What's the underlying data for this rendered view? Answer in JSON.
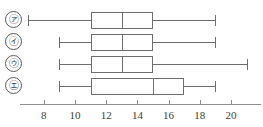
{
  "chart_data": {
    "type": "box",
    "title": "",
    "xlabel": "",
    "ylabel": "",
    "orientation": "horizontal",
    "grid": false,
    "legend": false,
    "xlim": [
      6.6,
      21.8
    ],
    "axis": {
      "ticks": [
        8,
        10,
        12,
        14,
        16,
        18,
        20
      ],
      "tick_labels": [
        "8",
        "10",
        "12",
        "14",
        "16",
        "18",
        "20"
      ]
    },
    "categories": [
      "㋐",
      "㋑",
      "㋒",
      "㋓"
    ],
    "boxes": [
      {
        "label": "㋐",
        "min": 7,
        "q1": 11,
        "median": 13,
        "q3": 15,
        "max": 19
      },
      {
        "label": "㋑",
        "min": 9,
        "q1": 11,
        "median": 13,
        "q3": 15,
        "max": 19
      },
      {
        "label": "㋒",
        "min": 9,
        "q1": 11,
        "median": 13,
        "q3": 15,
        "max": 21
      },
      {
        "label": "㋓",
        "min": 9,
        "q1": 11,
        "median": 15,
        "q3": 17,
        "max": 19
      }
    ],
    "colors": {
      "line": "#6e6e6e",
      "axis": "#8d8d8d",
      "box_fill": "#ffffff",
      "text": "#3c3c3c",
      "background": "#ffffff"
    }
  }
}
